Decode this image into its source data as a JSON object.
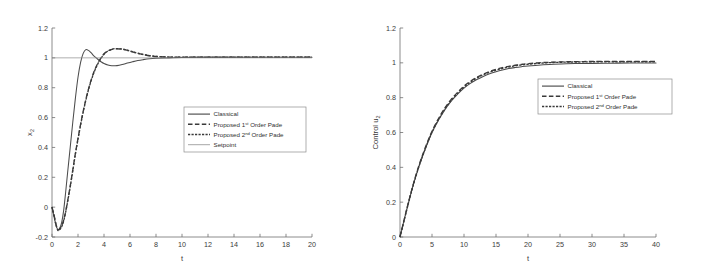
{
  "figure": {
    "background": "#ffffff",
    "panel_count": 2
  },
  "chart_data": [
    {
      "type": "line",
      "panel": "left",
      "title": "",
      "xlabel": "t",
      "ylabel": "x",
      "ylabel_sub": "2",
      "xlim": [
        0,
        20
      ],
      "ylim": [
        -0.2,
        1.2
      ],
      "xticks": [
        0,
        2,
        4,
        6,
        8,
        10,
        12,
        14,
        16,
        18,
        20
      ],
      "xticklabels": [
        "0",
        "2",
        "4",
        "6",
        "8",
        "10",
        "12",
        "14",
        "16",
        "18",
        "20"
      ],
      "yticks": [
        -0.2,
        0,
        0.2,
        0.4,
        0.6,
        0.8,
        1,
        1.2
      ],
      "yticklabels": [
        "-0.2",
        "0",
        "0.2",
        "0.4",
        "0.6",
        "0.8",
        "1",
        "1.2"
      ],
      "grid": false,
      "legend_position": "center-right",
      "legend": [
        {
          "label": "Classical",
          "style": "solid",
          "color": "#4c4c4c"
        },
        {
          "label_prefix": "Proposed 1",
          "label_sup": "st",
          "label_suffix": " Order Pade",
          "style": "dash-long",
          "color": "#3a3a3a"
        },
        {
          "label_prefix": "Proposed 2",
          "label_sup": "nd",
          "label_suffix": " Order Pade",
          "style": "dash-short",
          "color": "#3a3a3a"
        },
        {
          "label": "Setpoint",
          "style": "thin-solid",
          "color": "#8a8a8a"
        }
      ],
      "series": [
        {
          "name": "Classical",
          "style": "solid",
          "x": [
            0,
            0.15,
            0.3,
            0.45,
            0.6,
            0.75,
            0.9,
            1.05,
            1.2,
            1.4,
            1.6,
            1.8,
            2.0,
            2.2,
            2.4,
            2.6,
            2.8,
            3.0,
            3.2,
            3.4,
            3.6,
            3.8,
            4.0,
            4.3,
            4.6,
            5.0,
            5.4,
            5.8,
            6.2,
            6.6,
            7.0,
            7.5,
            8.0,
            9.0,
            10.0,
            12.0,
            14.0,
            16.0,
            18.0,
            20.0
          ],
          "y": [
            0.0,
            -0.06,
            -0.12,
            -0.15,
            -0.14,
            -0.1,
            -0.02,
            0.1,
            0.23,
            0.4,
            0.57,
            0.73,
            0.87,
            0.97,
            1.03,
            1.055,
            1.05,
            1.035,
            1.015,
            1.0,
            0.985,
            0.972,
            0.962,
            0.952,
            0.947,
            0.948,
            0.955,
            0.965,
            0.974,
            0.982,
            0.988,
            0.994,
            0.997,
            1.0,
            1.003,
            1.004,
            1.004,
            1.004,
            1.004,
            1.004
          ]
        },
        {
          "name": "Proposed 1st Order Pade",
          "style": "dash-long",
          "x": [
            0,
            0.15,
            0.3,
            0.45,
            0.6,
            0.8,
            1.0,
            1.2,
            1.4,
            1.6,
            1.8,
            2.0,
            2.3,
            2.6,
            2.9,
            3.2,
            3.5,
            3.8,
            4.1,
            4.4,
            4.7,
            5.0,
            5.4,
            5.8,
            6.2,
            6.6,
            7.0,
            7.5,
            8.0,
            9.0,
            10.0,
            12.0,
            14.0,
            16.0,
            18.0,
            20.0
          ],
          "y": [
            0.0,
            -0.05,
            -0.11,
            -0.15,
            -0.145,
            -0.115,
            -0.05,
            0.04,
            0.14,
            0.25,
            0.36,
            0.46,
            0.6,
            0.72,
            0.82,
            0.9,
            0.96,
            1.005,
            1.035,
            1.05,
            1.058,
            1.06,
            1.058,
            1.05,
            1.04,
            1.03,
            1.022,
            1.014,
            1.009,
            1.005,
            1.004,
            1.004,
            1.004,
            1.004,
            1.004,
            1.004
          ]
        },
        {
          "name": "Proposed 2nd Order Pade",
          "style": "dash-short",
          "x": [
            0,
            0.15,
            0.3,
            0.45,
            0.6,
            0.8,
            1.0,
            1.2,
            1.4,
            1.6,
            1.8,
            2.0,
            2.3,
            2.6,
            2.9,
            3.2,
            3.5,
            3.8,
            4.1,
            4.4,
            4.7,
            5.0,
            5.4,
            5.8,
            6.2,
            6.6,
            7.0,
            7.5,
            8.0,
            9.0,
            10.0,
            12.0,
            14.0,
            16.0,
            18.0,
            20.0
          ],
          "y": [
            0.0,
            -0.055,
            -0.115,
            -0.155,
            -0.15,
            -0.12,
            -0.055,
            0.035,
            0.135,
            0.245,
            0.355,
            0.455,
            0.595,
            0.715,
            0.815,
            0.895,
            0.955,
            1.0,
            1.033,
            1.05,
            1.06,
            1.062,
            1.059,
            1.051,
            1.041,
            1.031,
            1.023,
            1.015,
            1.01,
            1.005,
            1.004,
            1.004,
            1.004,
            1.004,
            1.004,
            1.004
          ]
        },
        {
          "name": "Setpoint",
          "style": "thin-solid",
          "x": [
            0,
            20
          ],
          "y": [
            1.0,
            1.0
          ]
        }
      ]
    },
    {
      "type": "line",
      "panel": "right",
      "title": "",
      "xlabel": "t",
      "ylabel": "Control u",
      "ylabel_sub": "2",
      "xlim": [
        0,
        40
      ],
      "ylim": [
        0,
        1.2
      ],
      "xticks": [
        0,
        5,
        10,
        15,
        20,
        25,
        30,
        35,
        40
      ],
      "xticklabels": [
        "0",
        "5",
        "10",
        "15",
        "20",
        "25",
        "30",
        "35",
        "40"
      ],
      "yticks": [
        0,
        0.2,
        0.4,
        0.6,
        0.8,
        1,
        1.2
      ],
      "yticklabels": [
        "0",
        "0.2",
        "0.4",
        "0.6",
        "0.8",
        "1",
        "1.2"
      ],
      "grid": false,
      "legend_position": "center-right",
      "legend": [
        {
          "label": "Classical",
          "style": "solid",
          "color": "#4c4c4c"
        },
        {
          "label_prefix": "Proposed 1",
          "label_sup": "st",
          "label_suffix": " Order Pade",
          "style": "dash-long",
          "color": "#3a3a3a"
        },
        {
          "label_prefix": "Proposed 2",
          "label_sup": "nd",
          "label_suffix": " Order Pade",
          "style": "dash-short",
          "color": "#3a3a3a"
        }
      ],
      "series": [
        {
          "name": "Classical",
          "style": "solid",
          "x": [
            0,
            1,
            2,
            3,
            4,
            5,
            6,
            7,
            8,
            9,
            10,
            11,
            12,
            13,
            14,
            15,
            16,
            17,
            18,
            19,
            20,
            22,
            24,
            26,
            28,
            30,
            33,
            36,
            40
          ],
          "y": [
            0.0,
            0.15,
            0.29,
            0.41,
            0.51,
            0.6,
            0.67,
            0.73,
            0.78,
            0.82,
            0.855,
            0.882,
            0.904,
            0.922,
            0.937,
            0.949,
            0.959,
            0.967,
            0.973,
            0.978,
            0.982,
            0.988,
            0.992,
            0.995,
            0.996,
            0.997,
            0.998,
            0.999,
            0.999
          ]
        },
        {
          "name": "Proposed 1st Order Pade",
          "style": "dash-long",
          "x": [
            0,
            1,
            2,
            3,
            4,
            5,
            6,
            7,
            8,
            9,
            10,
            11,
            12,
            13,
            14,
            15,
            16,
            17,
            18,
            19,
            20,
            22,
            24,
            26,
            28,
            30,
            33,
            36,
            40
          ],
          "y": [
            0.0,
            0.152,
            0.293,
            0.415,
            0.518,
            0.607,
            0.679,
            0.74,
            0.79,
            0.831,
            0.866,
            0.894,
            0.917,
            0.935,
            0.95,
            0.962,
            0.972,
            0.98,
            0.986,
            0.991,
            0.995,
            1.001,
            1.004,
            1.006,
            1.007,
            1.008,
            1.008,
            1.008,
            1.008
          ]
        },
        {
          "name": "Proposed 2nd Order Pade",
          "style": "dash-short",
          "x": [
            0,
            1,
            2,
            3,
            4,
            5,
            6,
            7,
            8,
            9,
            10,
            11,
            12,
            13,
            14,
            15,
            16,
            17,
            18,
            19,
            20,
            22,
            24,
            26,
            28,
            30,
            33,
            36,
            40
          ],
          "y": [
            0.0,
            0.148,
            0.288,
            0.409,
            0.512,
            0.601,
            0.673,
            0.734,
            0.784,
            0.826,
            0.861,
            0.889,
            0.912,
            0.931,
            0.946,
            0.958,
            0.968,
            0.976,
            0.983,
            0.988,
            0.992,
            0.998,
            1.002,
            1.004,
            1.005,
            1.006,
            1.006,
            1.006,
            1.006
          ]
        }
      ]
    }
  ]
}
